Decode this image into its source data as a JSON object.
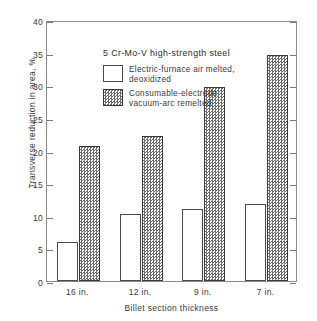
{
  "chart_data": {
    "type": "bar",
    "title": "5 Cr-Mo-V high-strength steel",
    "xlabel": "Billet section thickness",
    "ylabel": "Transverse reduction in area, %",
    "categories": [
      "16 in.",
      "12 in.",
      "9 in.",
      "7 in."
    ],
    "series": [
      {
        "name": "Electric-furnace air melted, deoxidized",
        "name_line1": "Electric-furnace air melted,",
        "name_line2": "deoxidized",
        "fill": "open",
        "values": [
          6.0,
          10.3,
          11.1,
          11.8
        ]
      },
      {
        "name": "Consumable-electrode vacuum-arc remelted",
        "name_line1": "Consumable-electrode",
        "name_line2": "vacuum-arc remelted",
        "fill": "checkered",
        "values": [
          20.7,
          22.2,
          29.8,
          34.6
        ]
      }
    ],
    "ylim": [
      0,
      40
    ],
    "yticks": [
      0,
      5,
      10,
      15,
      20,
      25,
      30,
      35,
      40
    ],
    "ytick_labels": [
      "0",
      "5",
      "10",
      "15",
      "20",
      "25",
      "30",
      "35",
      "40"
    ],
    "grid": false,
    "legend_position": "top-left",
    "colors": {
      "open_fill": "#ffffff",
      "checkered_fill": "#6e6e6e",
      "outline": "#4a4a4a",
      "axis": "#8a8a8a",
      "text": "#3a3a3a"
    }
  }
}
